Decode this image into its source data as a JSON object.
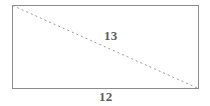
{
  "figure": {
    "name": "rectangle-with-diagonal",
    "background_color": "#ffffff",
    "stroke_color": "#8c8c8c",
    "diagonal_color": "#9a9a9a",
    "label_color": "#5d5d5d",
    "rectangle": {
      "x": 12,
      "y": 5,
      "width": 187,
      "height": 84,
      "stroke_width": 1
    },
    "diagonal": {
      "from": "top-left",
      "to": "bottom-right",
      "x1": 12,
      "y1": 5,
      "x2": 199,
      "y2": 89,
      "style": "dashed",
      "dash_pattern": "2 3",
      "stroke_width": 1
    },
    "labels": {
      "diagonal": "13",
      "base": "12"
    }
  },
  "chart_data": {
    "type": "diagram",
    "title": "",
    "shape": "rectangle",
    "measurements": [
      {
        "element": "diagonal",
        "value": 13
      },
      {
        "element": "base",
        "value": 12
      }
    ]
  }
}
